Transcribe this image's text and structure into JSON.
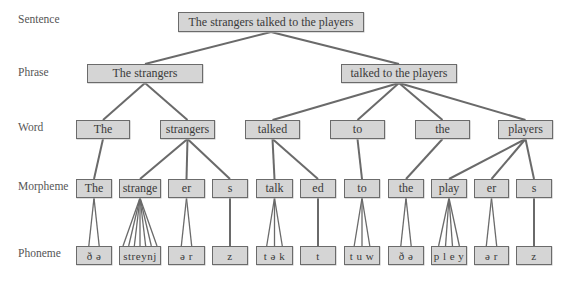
{
  "diagram": {
    "type": "hierarchy",
    "colors": {
      "box_fill": "#d5d5d5",
      "box_border": "#6b6b6b",
      "line": "#6a6a6a",
      "label_text": "#555555"
    },
    "levels": [
      {
        "id": "sentence",
        "label": "Sentence",
        "y": 12,
        "h": 20
      },
      {
        "id": "phrase",
        "label": "Phrase",
        "y": 64,
        "h": 19
      },
      {
        "id": "word",
        "label": "Word",
        "y": 120,
        "h": 19
      },
      {
        "id": "morpheme",
        "label": "Morpheme",
        "y": 179,
        "h": 19
      },
      {
        "id": "phoneme",
        "label": "Phoneme",
        "y": 246,
        "h": 19
      }
    ],
    "nodes": [
      {
        "id": "s1",
        "level": "sentence",
        "text": "The strangers talked to the players",
        "x": 178,
        "w": 186
      },
      {
        "id": "p1",
        "level": "phrase",
        "text": "The strangers",
        "x": 87,
        "w": 116,
        "parent": "s1"
      },
      {
        "id": "p2",
        "level": "phrase",
        "text": "talked to the players",
        "x": 341,
        "w": 116,
        "parent": "s1"
      },
      {
        "id": "w1",
        "level": "word",
        "text": "The",
        "x": 76,
        "w": 54,
        "parent": "p1"
      },
      {
        "id": "w2",
        "level": "word",
        "text": "strangers",
        "x": 160,
        "w": 55,
        "parent": "p1"
      },
      {
        "id": "w3",
        "level": "word",
        "text": "talked",
        "x": 245,
        "w": 55,
        "parent": "p2"
      },
      {
        "id": "w4",
        "level": "word",
        "text": "to",
        "x": 330,
        "w": 55,
        "parent": "p2"
      },
      {
        "id": "w5",
        "level": "word",
        "text": "the",
        "x": 415,
        "w": 55,
        "parent": "p2"
      },
      {
        "id": "w6",
        "level": "word",
        "text": "players",
        "x": 498,
        "w": 55,
        "parent": "p2"
      },
      {
        "id": "m1",
        "level": "morpheme",
        "text": "The",
        "x": 76,
        "w": 36,
        "parent": "w1"
      },
      {
        "id": "m2",
        "level": "morpheme",
        "text": "strange",
        "x": 119,
        "w": 42,
        "parent": "w2"
      },
      {
        "id": "m3",
        "level": "morpheme",
        "text": "er",
        "x": 168,
        "w": 37,
        "parent": "w2"
      },
      {
        "id": "m4",
        "level": "morpheme",
        "text": "s",
        "x": 212,
        "w": 36,
        "parent": "w2"
      },
      {
        "id": "m5",
        "level": "morpheme",
        "text": "talk",
        "x": 256,
        "w": 37,
        "parent": "w3"
      },
      {
        "id": "m6",
        "level": "morpheme",
        "text": "ed",
        "x": 300,
        "w": 36,
        "parent": "w3"
      },
      {
        "id": "m7",
        "level": "morpheme",
        "text": "to",
        "x": 344,
        "w": 36,
        "parent": "w4"
      },
      {
        "id": "m8",
        "level": "morpheme",
        "text": "the",
        "x": 388,
        "w": 36,
        "parent": "w5"
      },
      {
        "id": "m9",
        "level": "morpheme",
        "text": "play",
        "x": 431,
        "w": 36,
        "parent": "w6"
      },
      {
        "id": "m10",
        "level": "morpheme",
        "text": "er",
        "x": 474,
        "w": 35,
        "parent": "w6"
      },
      {
        "id": "m11",
        "level": "morpheme",
        "text": "s",
        "x": 516,
        "w": 36,
        "parent": "w6"
      },
      {
        "id": "ph1",
        "level": "phoneme",
        "text": "ð ə",
        "x": 76,
        "w": 36,
        "parent": "m1",
        "fan": 2
      },
      {
        "id": "ph2",
        "level": "phoneme",
        "text": "streynj",
        "x": 119,
        "w": 42,
        "parent": "m2",
        "fan": 7
      },
      {
        "id": "ph3",
        "level": "phoneme",
        "text": "ə r",
        "x": 168,
        "w": 37,
        "parent": "m3",
        "fan": 2
      },
      {
        "id": "ph4",
        "level": "phoneme",
        "text": "z",
        "x": 212,
        "w": 36,
        "parent": "m4",
        "fan": 1
      },
      {
        "id": "ph5",
        "level": "phoneme",
        "text": "t ə k",
        "x": 256,
        "w": 37,
        "parent": "m5",
        "fan": 3
      },
      {
        "id": "ph6",
        "level": "phoneme",
        "text": "t",
        "x": 300,
        "w": 36,
        "parent": "m6",
        "fan": 1
      },
      {
        "id": "ph7",
        "level": "phoneme",
        "text": "t u w",
        "x": 344,
        "w": 36,
        "parent": "m7",
        "fan": 3
      },
      {
        "id": "ph8",
        "level": "phoneme",
        "text": "ð ə",
        "x": 388,
        "w": 36,
        "parent": "m8",
        "fan": 2
      },
      {
        "id": "ph9",
        "level": "phoneme",
        "text": "p l e y",
        "x": 431,
        "w": 36,
        "parent": "m9",
        "fan": 4
      },
      {
        "id": "ph10",
        "level": "phoneme",
        "text": "ə r",
        "x": 474,
        "w": 35,
        "parent": "m10",
        "fan": 2
      },
      {
        "id": "ph11",
        "level": "phoneme",
        "text": "z",
        "x": 516,
        "w": 36,
        "parent": "m11",
        "fan": 1
      }
    ]
  }
}
